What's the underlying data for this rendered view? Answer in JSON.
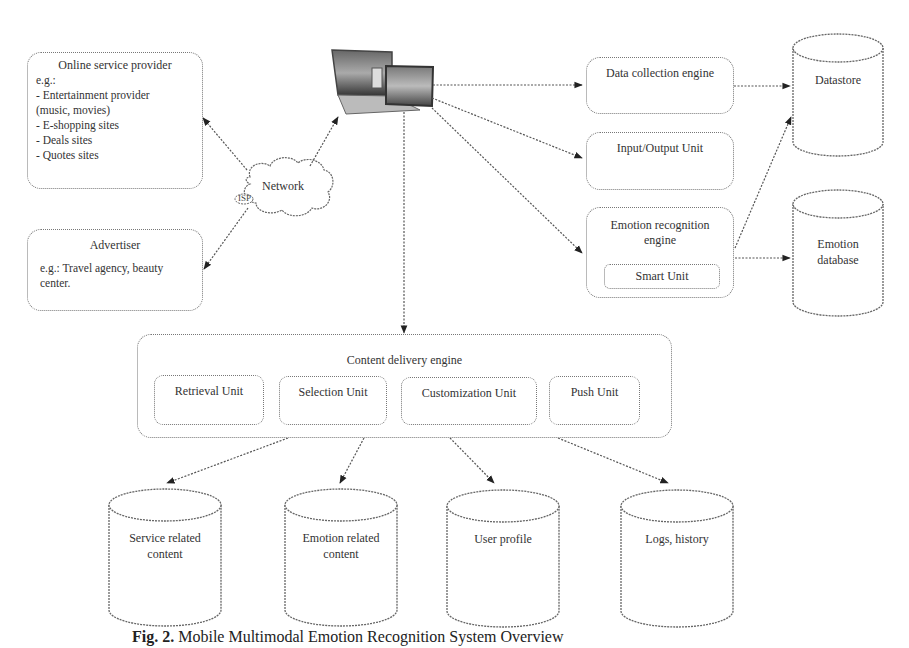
{
  "diagram": {
    "online_provider": {
      "title": "Online service provider",
      "lines": [
        "e.g.:",
        "- Entertainment provider",
        "(music, movies)",
        "- E-shopping sites",
        "- Deals sites",
        "- Quotes sites"
      ]
    },
    "network": {
      "label": "Network",
      "sub": "ISP"
    },
    "advertiser": {
      "title": "Advertiser",
      "lines": [
        "e.g.: Travel agency, beauty",
        "center."
      ]
    },
    "device": {
      "icon": "laptop-tablet-icon"
    },
    "data_collection": {
      "title": "Data collection engine"
    },
    "io_unit": {
      "title": "Input/Output Unit"
    },
    "emotion_engine": {
      "title_line1": "Emotion recognition",
      "title_line2": "engine",
      "smart_unit": "Smart Unit"
    },
    "datastore": {
      "label": "Datastore"
    },
    "emotion_db": {
      "line1": "Emotion",
      "line2": "database"
    },
    "content_delivery": {
      "title": "Content delivery engine",
      "units": [
        "Retrieval Unit",
        "Selection Unit",
        "Customization Unit",
        "Push Unit"
      ]
    },
    "stores": [
      {
        "line1": "Service related",
        "line2": "content"
      },
      {
        "line1": "Emotion related",
        "line2": "content"
      },
      {
        "line1": "User profile",
        "line2": ""
      },
      {
        "line1": "Logs, history",
        "line2": ""
      }
    ]
  },
  "caption": {
    "label": "Fig. 2.",
    "text": "Mobile Multimodal Emotion Recognition System Overview"
  }
}
